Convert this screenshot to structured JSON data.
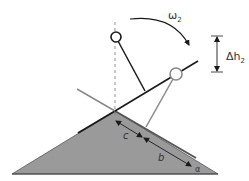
{
  "diagram": {
    "labels": {
      "omega": "ω",
      "omega_sub": "2",
      "delta_h": "Δh",
      "delta_h_sub": "2",
      "c": "c",
      "b": "b",
      "alpha": "α"
    },
    "colors": {
      "slope_fill": "#9a9a9a",
      "line_black": "#1a1a1a",
      "line_gray": "#8a8a8a",
      "background": "#ffffff"
    }
  }
}
